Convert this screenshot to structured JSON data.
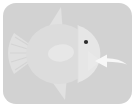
{
  "canvas": {
    "width": 135,
    "height": 107,
    "outer_background": "#ffffff"
  },
  "card": {
    "background": "#d2d2d2",
    "corner_radius": 13,
    "x": 3,
    "y": 3,
    "width": 129,
    "height": 101
  },
  "illustration": {
    "subject": "fish",
    "style": "flat monochrome low-contrast icon",
    "alt_text": "Light gray fish icon with a white arrow pointing at its mouth",
    "colors": {
      "card_background": "#d2d2d2",
      "fish_body": "#dcdcdc",
      "fish_fins": "#e0e0e0",
      "fish_head": "#e6e6e6",
      "fish_mouth": "#e9e9e9",
      "pectoral_fin": "#e7e7e7",
      "tail_rays": "#d6d6d6",
      "eye": "#2b2b2b",
      "arrow": "#f7f7f7"
    },
    "parts": [
      {
        "name": "tail-fin",
        "label": "Tail fin"
      },
      {
        "name": "body",
        "label": "Body"
      },
      {
        "name": "dorsal-fin",
        "label": "Dorsal fin"
      },
      {
        "name": "ventral-fin",
        "label": "Ventral fin"
      },
      {
        "name": "pectoral-fin",
        "label": "Pectoral fin"
      },
      {
        "name": "head",
        "label": "Head"
      },
      {
        "name": "mouth",
        "label": "Mouth"
      },
      {
        "name": "eye",
        "label": "Eye"
      }
    ]
  },
  "annotation": {
    "arrow": {
      "name": "pointer-arrow",
      "label": "Arrow pointing left at fish mouth",
      "direction": "left",
      "color": "#f7f7f7",
      "tip_x": 95,
      "tip_y": 60
    }
  }
}
